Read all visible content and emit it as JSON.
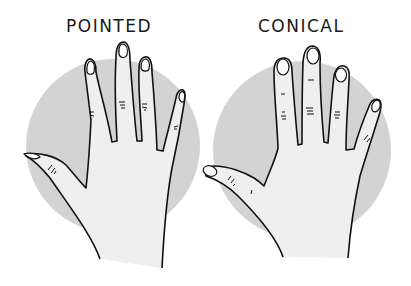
{
  "figure": {
    "panels": [
      {
        "label": "POINTED",
        "description": "hand with pointed fingertips and pointed nails"
      },
      {
        "label": "CONICAL",
        "description": "hand with conical fingers and rounded nails"
      }
    ],
    "colors": {
      "circle": "#d3d3d3",
      "hand_fill": "#efefef",
      "outline": "#111111",
      "background": "#ffffff"
    }
  }
}
